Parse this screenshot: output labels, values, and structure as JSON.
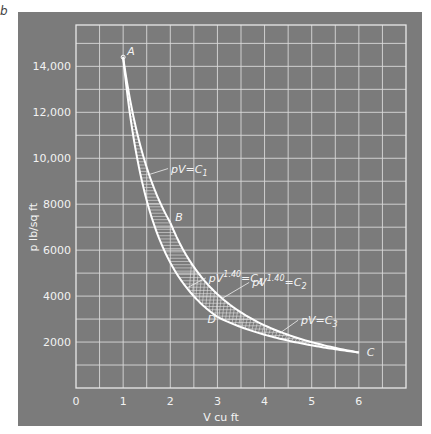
{
  "figure_letter": "b",
  "chart_data": {
    "type": "line",
    "title": "",
    "xlabel": "V cu ft",
    "ylabel": "p lb/sq ft",
    "xlim": [
      0,
      7
    ],
    "ylim": [
      0,
      15800
    ],
    "grid": true,
    "grid_step": {
      "x": 0.5,
      "y": 1000
    },
    "x_ticks": [
      {
        "value": 0,
        "label": "0"
      },
      {
        "value": 1,
        "label": "1"
      },
      {
        "value": 2,
        "label": "2"
      },
      {
        "value": 3,
        "label": "3"
      },
      {
        "value": 4,
        "label": "4"
      },
      {
        "value": 5,
        "label": "5"
      },
      {
        "value": 6,
        "label": "6"
      }
    ],
    "y_ticks": [
      {
        "value": 2000,
        "label": "2000"
      },
      {
        "value": 4000,
        "label": "4000"
      },
      {
        "value": 6000,
        "label": "6000"
      },
      {
        "value": 8000,
        "label": "8000"
      },
      {
        "value": 10000,
        "label": "10,000"
      },
      {
        "value": 12000,
        "label": "12,000"
      },
      {
        "value": 14000,
        "label": "14,000"
      }
    ],
    "points": [
      {
        "name": "A",
        "V": 1,
        "p": 14400
      },
      {
        "name": "B",
        "V": 2,
        "p": 7200
      },
      {
        "name": "C",
        "V": 6,
        "p": 1547
      },
      {
        "name": "D",
        "V": 3,
        "p": 3093
      }
    ],
    "series": [
      {
        "name": "pV = C1",
        "label": "pV=C",
        "sub": "1",
        "exp": "",
        "from": "A",
        "to": "B",
        "n": 1.0,
        "V": [
          1,
          1.25,
          1.5,
          1.75,
          2
        ],
        "p": [
          14400,
          11520,
          9600,
          8229,
          7200
        ]
      },
      {
        "name": "pV^1.40 = C4",
        "label": "pV",
        "sub": "4",
        "exp": "1.40",
        "from": "B",
        "to": "C",
        "n": 1.4,
        "V": [
          2,
          3,
          4,
          5,
          6
        ],
        "p": [
          7200,
          4085,
          2729,
          2001,
          1547
        ]
      },
      {
        "name": "pV^1.40 = C2",
        "label": "pV",
        "sub": "2",
        "exp": "1.40",
        "from": "A",
        "to": "D",
        "n": 1.4,
        "V": [
          1,
          1.5,
          2,
          2.5,
          3
        ],
        "p": [
          14400,
          8000,
          5457,
          3986,
          3093
        ]
      },
      {
        "name": "pV = C3",
        "label": "pV=C",
        "sub": "3",
        "exp": "",
        "from": "D",
        "to": "C",
        "n": 1.0,
        "V": [
          3,
          4,
          5,
          6
        ],
        "p": [
          3093,
          2320,
          1856,
          1547
        ]
      }
    ],
    "shaded_region": "between upper path A-B-C and lower path A-D-C (hatched)",
    "annotations": [
      {
        "text": "pV=C1",
        "near": "pV=C1",
        "at_V": 1.6
      },
      {
        "text": "pV^1.40=C4",
        "near": "pV^1.40=C4",
        "at_V": 2.3
      },
      {
        "text": "pV^1.40=C2",
        "near": "pV^1.40=C2",
        "at_V": 3.5
      },
      {
        "text": "pV=C3",
        "near": "pV=C3",
        "at_V": 4.4
      }
    ]
  }
}
